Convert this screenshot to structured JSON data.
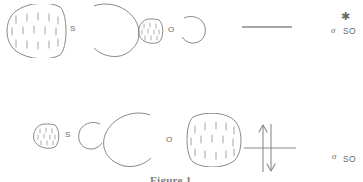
{
  "figure": {
    "caption": "Figure 1",
    "stroke_color": "#7a7a7a",
    "text_color": "#666666"
  },
  "rows": [
    {
      "id": "antibonding",
      "name": "antibonding-row",
      "left_atom_label": "S",
      "right_atom_label": "O",
      "energy_level": {
        "name": "antibonding-energy-level",
        "electrons": [],
        "electron_count": 0
      },
      "mo_label": {
        "symbol": "σ",
        "superscript": "✱",
        "subscript": "SO"
      }
    },
    {
      "id": "bonding",
      "name": "bonding-row",
      "left_atom_label": "S",
      "right_atom_label": "O",
      "energy_level": {
        "name": "bonding-energy-level",
        "electrons": [
          "up",
          "down"
        ],
        "electron_count": 2
      },
      "mo_label": {
        "symbol": "σ",
        "superscript": "",
        "subscript": "SO"
      }
    }
  ]
}
